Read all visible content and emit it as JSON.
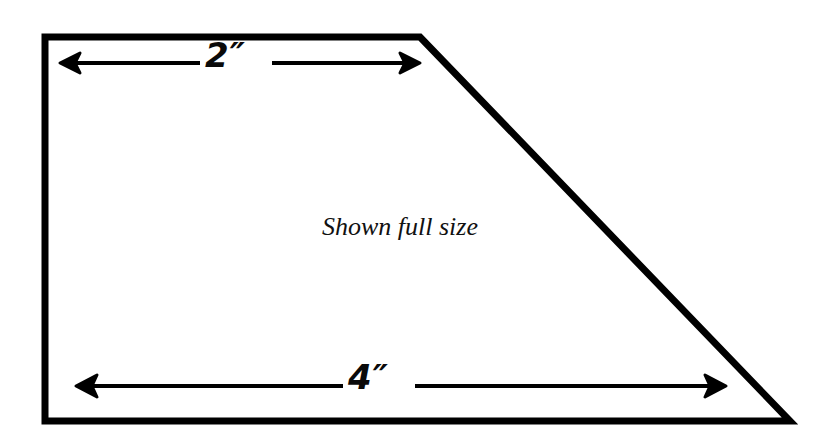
{
  "figure": {
    "caption": "Shown full size",
    "shape_name": "right-trapezoid-pattern",
    "stroke_color": "#000000",
    "background_color": "#ffffff",
    "dimensions": [
      {
        "id": "top",
        "label": "2″",
        "value": 2,
        "unit": "inch",
        "edge": "top",
        "style": "double-headed-arrow"
      },
      {
        "id": "bottom",
        "label": "4″",
        "value": 4,
        "unit": "inch",
        "edge": "bottom",
        "style": "double-headed-arrow"
      }
    ]
  }
}
